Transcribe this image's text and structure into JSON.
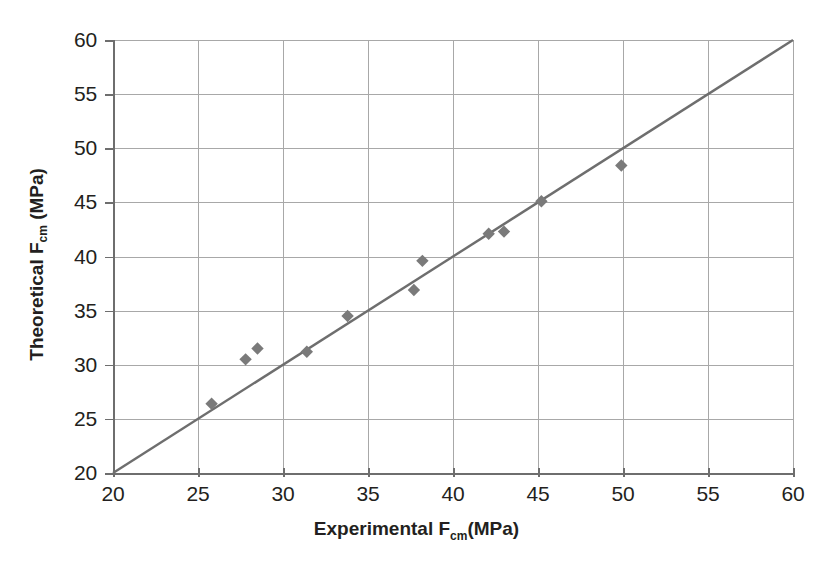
{
  "chart_data": {
    "type": "scatter",
    "title": "",
    "xlabel": "Experimental Fcm(MPa)",
    "xlabel_parts": {
      "pre": "Experimental F",
      "sub": "cm",
      "post": "(MPa)"
    },
    "ylabel": "Theoretical Fcm (MPa)",
    "ylabel_parts": {
      "pre": "Theoretical F",
      "sub": "cm",
      "post": " (MPa)"
    },
    "xlim": [
      20,
      60
    ],
    "ylim": [
      20,
      60
    ],
    "xticks": [
      20,
      25,
      30,
      35,
      40,
      45,
      50,
      55,
      60
    ],
    "yticks": [
      20,
      25,
      30,
      35,
      40,
      45,
      50,
      55,
      60
    ],
    "xtick_labels": [
      "20",
      "25",
      "30",
      "35",
      "40",
      "45",
      "50",
      "55",
      "60"
    ],
    "ytick_labels": [
      "20",
      "25",
      "30",
      "35",
      "40",
      "45",
      "50",
      "55",
      "60"
    ],
    "grid": true,
    "legend": false,
    "marker": "diamond",
    "marker_color": "#7a7a7a",
    "line_color": "#6e6e6e",
    "grid_color": "#a8a8a8",
    "series": [
      {
        "name": "data",
        "type": "scatter",
        "points": [
          {
            "x": 25.8,
            "y": 26.4
          },
          {
            "x": 27.8,
            "y": 30.5
          },
          {
            "x": 28.5,
            "y": 31.5
          },
          {
            "x": 31.4,
            "y": 31.2
          },
          {
            "x": 33.8,
            "y": 34.5
          },
          {
            "x": 37.7,
            "y": 36.9
          },
          {
            "x": 38.2,
            "y": 39.6
          },
          {
            "x": 42.1,
            "y": 42.1
          },
          {
            "x": 43.0,
            "y": 42.3
          },
          {
            "x": 45.2,
            "y": 45.1
          },
          {
            "x": 49.9,
            "y": 48.4
          }
        ]
      },
      {
        "name": "equality-line",
        "type": "line",
        "points": [
          {
            "x": 20,
            "y": 20
          },
          {
            "x": 60,
            "y": 60
          }
        ]
      }
    ]
  },
  "figure": {
    "background_color": "#ffffff",
    "text_color": "#231f20"
  }
}
